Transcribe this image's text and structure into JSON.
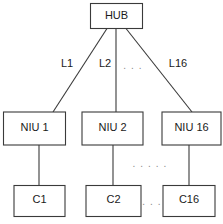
{
  "diagram": {
    "background_color": "#ffffff",
    "line_color": "#3a3a3a",
    "text_color": "#1a1a1a",
    "ellipsis_color": "#8a8a8a",
    "nodes": {
      "hub": {
        "label": "HUB"
      },
      "niu1": {
        "label": "NIU  1"
      },
      "niu2": {
        "label": "NIU  2"
      },
      "niu16": {
        "label": "NIU  16"
      },
      "c1": {
        "label": "C1"
      },
      "c2": {
        "label": "C2"
      },
      "c16": {
        "label": "C16"
      }
    },
    "links": {
      "l1": {
        "label": "L1"
      },
      "l2": {
        "label": "L2"
      },
      "l16": {
        "label": "L16"
      }
    },
    "ellipses": {
      "links_gap": ". . .",
      "niu_gap": ". . . . .",
      "c_gap": ". . ."
    }
  }
}
